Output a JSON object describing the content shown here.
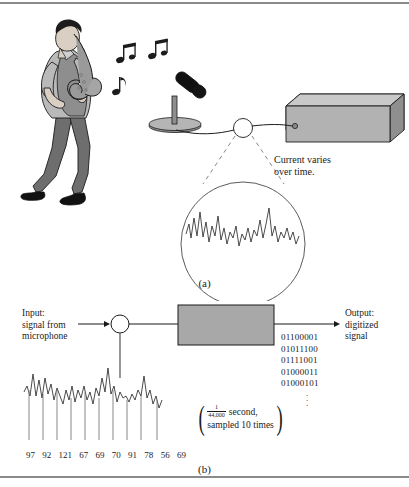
{
  "figure": {
    "panel_a": {
      "caption": "(a)",
      "annotation": "Current varies\nover time.",
      "scene_items": [
        "saxophone-player",
        "music-notes",
        "microphone",
        "amplifier-box",
        "cable",
        "magnifier-circle",
        "analog-waveform"
      ]
    },
    "panel_b": {
      "caption": "(b)",
      "input_label": "Input:\nsignal from\nmicrophone",
      "output_label": "Output:\ndigitized\nsignal",
      "converter_label": "A/D converter",
      "converter_fill": "#a8a8a8",
      "bit_lines": [
        "01100001",
        "01011100",
        "01111001",
        "01000011",
        "01000101"
      ],
      "bits_continuation": "vertical-ellipsis",
      "rate_note": {
        "fraction_numerator": "1",
        "fraction_denominator": "44,000",
        "unit": "second,",
        "second_line": "sampled 10 times"
      },
      "sample_values": [
        97,
        92,
        121,
        67,
        69,
        70,
        91,
        78,
        56,
        69
      ]
    }
  },
  "colors": {
    "rule": "#8a8a8a",
    "ink": "#1a1a1a",
    "skin": "#d9cfc3",
    "shirt": "#b9b9b9",
    "vest": "#8e8e8e",
    "pants": "#6e6e6e",
    "hair": "#1c1c1c",
    "sax": "#9a9a9a",
    "box_top": "#c9c9c9",
    "box_front": "#b2b2b2",
    "box_side": "#8f8f8f",
    "converter": "#a8a8a8"
  }
}
